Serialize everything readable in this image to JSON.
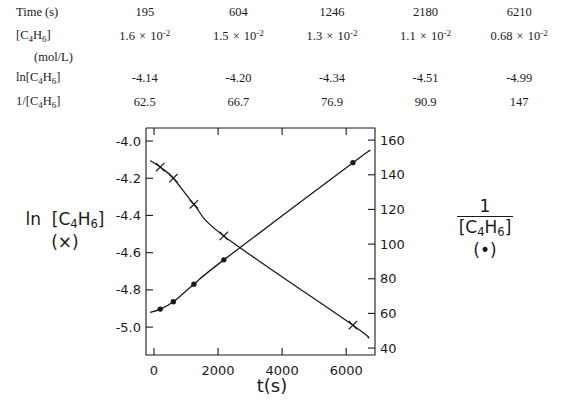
{
  "table": {
    "rows": [
      {
        "label_html": "Time (s)",
        "label_plain": "Time (s)",
        "values": [
          "195",
          "604",
          "1246",
          "2180",
          "6210"
        ]
      },
      {
        "label_plain": "[C4H6]",
        "sub_label_plain": "(mol/L)",
        "values": [
          "1.6 × 10⁻²",
          "1.5 × 10⁻²",
          "1.3 × 10⁻²",
          "1.1 × 10⁻²",
          "0.68 × 10⁻²"
        ],
        "mantissas": [
          "1.6",
          "1.5",
          "1.3",
          "1.1",
          "0.68"
        ],
        "exponent": "-2",
        "base": "10"
      },
      {
        "label_plain": "ln[C4H6]",
        "values": [
          "-4.14",
          "-4.20",
          "-4.34",
          "-4.51",
          "-4.99"
        ]
      },
      {
        "label_plain": "1/[C4H6]",
        "values": [
          "62.5",
          "66.7",
          "76.9",
          "90.9",
          "147"
        ]
      }
    ]
  },
  "chart_data": {
    "type": "line",
    "title": "",
    "xlabel": "t(s)",
    "x": [
      195,
      604,
      1246,
      2180,
      6210
    ],
    "axes": {
      "x": {
        "label": "t(s)",
        "ticks": [
          0,
          2000,
          4000,
          6000
        ],
        "ticklabels": [
          "0",
          "2000",
          "4000",
          "6000"
        ],
        "range": [
          -250,
          6900
        ]
      },
      "y_left": {
        "label": "ln [C4H6] (×)",
        "ticks": [
          -4.0,
          -4.2,
          -4.4,
          -4.6,
          -4.8,
          -5.0
        ],
        "ticklabels": [
          "-4.0",
          "-4.2",
          "-4.4",
          "-4.6",
          "-4.8",
          "-5.0"
        ],
        "range": [
          -5.15,
          -3.93
        ]
      },
      "y_right": {
        "label": "1/[C4H6] (•)",
        "ticks": [
          40,
          60,
          80,
          100,
          120,
          140,
          160
        ],
        "ticklabels": [
          "40",
          "60",
          "80",
          "100",
          "120",
          "140",
          "160"
        ],
        "range": [
          36,
          167
        ]
      },
      "grid": false
    },
    "series": [
      {
        "name": "ln[C4H6]",
        "marker": "x",
        "axis": "y_left",
        "values": [
          -4.14,
          -4.2,
          -4.34,
          -4.51,
          -4.99
        ]
      },
      {
        "name": "1/[C4H6]",
        "marker": "dot",
        "axis": "y_right",
        "values": [
          62.5,
          66.7,
          76.9,
          90.9,
          147
        ]
      }
    ],
    "legend": {
      "position": "axis-labels",
      "entries": [
        "(×)",
        "(•)"
      ]
    },
    "colors": {
      "ink": "#1a1a1a",
      "background": "#ffffff"
    }
  },
  "labels": {
    "y_left_main": "ln",
    "y_left_bracket_open": "[C",
    "y_left_sub1": "4",
    "y_left_h": "H",
    "y_left_sub2": "6",
    "y_left_bracket_close": "]",
    "y_left_marker": "(×)",
    "y_right_numerator": "1",
    "y_right_marker": "(•)",
    "x_axis": "t(s)"
  }
}
